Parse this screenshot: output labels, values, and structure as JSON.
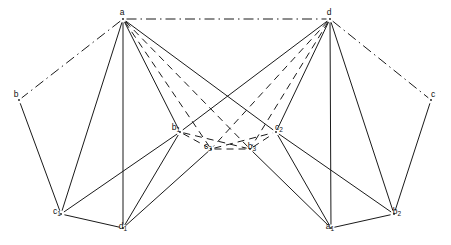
{
  "figure": {
    "background_color": "#ffffff",
    "line_color": "#1a1a1a"
  },
  "nodes": [
    {
      "id": "a",
      "label": "a",
      "sub": "",
      "x": 123,
      "y": 19,
      "lx": 122,
      "ly": 12
    },
    {
      "id": "d",
      "label": "d",
      "sub": "",
      "x": 330,
      "y": 19,
      "lx": 329,
      "ly": 12
    },
    {
      "id": "b",
      "label": "b",
      "sub": "",
      "x": 19,
      "y": 100,
      "lx": 16,
      "ly": 94
    },
    {
      "id": "c",
      "label": "c",
      "sub": "",
      "x": 431,
      "y": 100,
      "lx": 433,
      "ly": 94
    },
    {
      "id": "b1",
      "label": "b",
      "sub": "1",
      "x": 180,
      "y": 132,
      "lx": 176,
      "ly": 127
    },
    {
      "id": "c2",
      "label": "c",
      "sub": "2",
      "x": 276,
      "y": 132,
      "lx": 279,
      "ly": 127
    },
    {
      "id": "c3",
      "label": "c",
      "sub": "3",
      "x": 211,
      "y": 149,
      "lx": 208,
      "ly": 146
    },
    {
      "id": "b3",
      "label": "b",
      "sub": "3",
      "x": 250,
      "y": 149,
      "lx": 252,
      "ly": 146
    },
    {
      "id": "c1",
      "label": "c",
      "sub": "1",
      "x": 61,
      "y": 214,
      "lx": 57,
      "ly": 211
    },
    {
      "id": "d1",
      "label": "d",
      "sub": "1",
      "x": 123,
      "y": 228,
      "lx": 123,
      "ly": 226
    },
    {
      "id": "a1",
      "label": "a",
      "sub": "1",
      "x": 331,
      "y": 228,
      "lx": 330,
      "ly": 226
    },
    {
      "id": "b2",
      "label": "b",
      "sub": "2",
      "x": 394,
      "y": 214,
      "lx": 397,
      "ly": 211
    }
  ],
  "edges": [
    {
      "from": "a",
      "to": "d",
      "style": "dashdot"
    },
    {
      "from": "a",
      "to": "b",
      "style": "dashdot"
    },
    {
      "from": "d",
      "to": "c",
      "style": "dashdot"
    },
    {
      "from": "b",
      "to": "c1",
      "style": "solid"
    },
    {
      "from": "a",
      "to": "c1",
      "style": "solid"
    },
    {
      "from": "a",
      "to": "d1",
      "style": "solid"
    },
    {
      "from": "a",
      "to": "b1",
      "style": "solid"
    },
    {
      "from": "a",
      "to": "c2",
      "style": "solid"
    },
    {
      "from": "a",
      "to": "c3",
      "style": "dashed"
    },
    {
      "from": "a",
      "to": "b3",
      "style": "dashed"
    },
    {
      "from": "c",
      "to": "b2",
      "style": "solid"
    },
    {
      "from": "d",
      "to": "b2",
      "style": "solid"
    },
    {
      "from": "d",
      "to": "a1",
      "style": "solid"
    },
    {
      "from": "d",
      "to": "c2",
      "style": "solid"
    },
    {
      "from": "d",
      "to": "b1",
      "style": "solid"
    },
    {
      "from": "d",
      "to": "b3",
      "style": "dashed"
    },
    {
      "from": "d",
      "to": "c3",
      "style": "dashed"
    },
    {
      "from": "c1",
      "to": "d1",
      "style": "solid"
    },
    {
      "from": "c1",
      "to": "b1",
      "style": "solid"
    },
    {
      "from": "b1",
      "to": "d1",
      "style": "solid"
    },
    {
      "from": "b1",
      "to": "c3",
      "style": "dashed"
    },
    {
      "from": "b1",
      "to": "b3",
      "style": "dashed"
    },
    {
      "from": "c3",
      "to": "b3",
      "style": "dashed"
    },
    {
      "from": "c3",
      "to": "d1",
      "style": "solid"
    },
    {
      "from": "b3",
      "to": "a1",
      "style": "solid"
    },
    {
      "from": "b3",
      "to": "c2",
      "style": "dashed"
    },
    {
      "from": "c3",
      "to": "c2",
      "style": "dashed"
    },
    {
      "from": "c2",
      "to": "a1",
      "style": "solid"
    },
    {
      "from": "c2",
      "to": "b2",
      "style": "solid"
    },
    {
      "from": "a1",
      "to": "b2",
      "style": "solid"
    }
  ]
}
